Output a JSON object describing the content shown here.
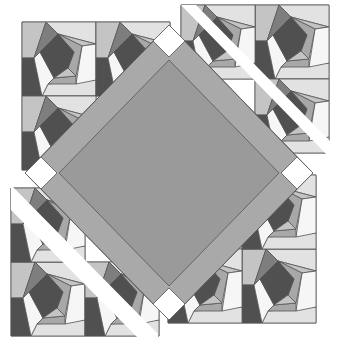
{
  "image": {
    "title": "Quilt block pattern",
    "description": "Square-in-a-square medallion with white cornerstones, flanked by twisted log-cabin (paper-pieced spiral) blocks in grayscale"
  },
  "palette": {
    "background": "#ffffff",
    "center": "#9a9a9a",
    "border": "#a9a9a9",
    "cornerstone": "#ffffff",
    "dark": "#505050",
    "medium_dark": "#7e7e7e",
    "medium": "#a8a8a8",
    "light": "#c4c4c4",
    "very_light": "#e2e2e2",
    "white": "#f6f6f6",
    "seam": "#555555"
  },
  "medallion": {
    "center_square": {
      "cx": 169,
      "cy": 173,
      "half_diagonal": 109
    },
    "border_width": 17,
    "cornerstones": [
      "top",
      "right",
      "bottom",
      "left"
    ]
  },
  "spiral_blocks": {
    "top_left": {
      "x": 22,
      "y": 22,
      "size": 74
    },
    "top_right": {
      "x": 255,
      "y": 5,
      "size": 74
    },
    "bottom_left": {
      "x": 11,
      "y": 262,
      "size": 74
    },
    "bottom_right": {
      "x": 242,
      "y": 249,
      "size": 74
    }
  }
}
